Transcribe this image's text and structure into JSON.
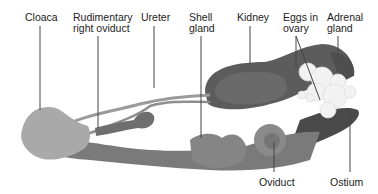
{
  "diagram": {
    "colors": {
      "background": "#ffffff",
      "leader_line": "#444444",
      "label_text": "#222222",
      "cloaca": "#a9a9a9",
      "oviduct": "#7a7a7a",
      "kidney": "#5a5a5a",
      "eggs": "#f2f2f2",
      "ureter": "#9a9a9a"
    },
    "labels": [
      {
        "id": "cloaca",
        "text": "Cloaca"
      },
      {
        "id": "rudimentary-right-oviduct",
        "text": "Rudimentary\nright oviduct"
      },
      {
        "id": "ureter",
        "text": "Ureter"
      },
      {
        "id": "shell-gland",
        "text": "Shell\ngland"
      },
      {
        "id": "kidney",
        "text": "Kidney"
      },
      {
        "id": "eggs-in-ovary",
        "text": "Eggs in\novary"
      },
      {
        "id": "adrenal-gland",
        "text": "Adrenal\ngland"
      },
      {
        "id": "oviduct",
        "text": "Oviduct"
      },
      {
        "id": "ostium",
        "text": "Ostium"
      }
    ]
  }
}
